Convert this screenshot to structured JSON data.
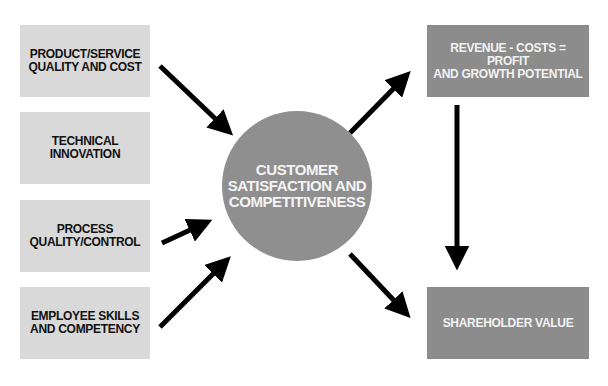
{
  "diagram": {
    "inputs": [
      {
        "label": "PRODUCT/SERVICE\nQUALITY AND COST"
      },
      {
        "label": "TECHNICAL\nINNOVATION"
      },
      {
        "label": "PROCESS\nQUALITY/CONTROL"
      },
      {
        "label": "EMPLOYEE SKILLS\nAND COMPETENCY"
      }
    ],
    "center": {
      "label": "CUSTOMER\nSATISFACTION AND\nCOMPETITIVENESS"
    },
    "outputs": [
      {
        "label": "REVENUE - COSTS = PROFIT\nAND GROWTH POTENTIAL"
      },
      {
        "label": "SHAREHOLDER VALUE"
      }
    ],
    "colors": {
      "input_box": "#d9d9d9",
      "output_box": "#8c8c8c",
      "circle": "#8f8f8f",
      "arrow": "#000000"
    }
  }
}
